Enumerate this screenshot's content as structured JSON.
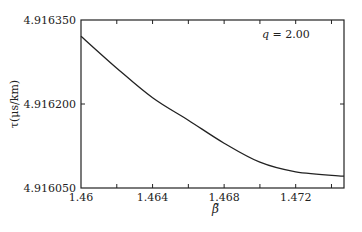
{
  "chart_data": {
    "type": "line",
    "title": "",
    "xlabel": "β̃",
    "ylabel": "τ(μs/km)",
    "annotation": "q = 2.00",
    "annotation_var": "q",
    "annotation_value": "2.00",
    "xlim": [
      1.46,
      1.4747
    ],
    "ylim": [
      4.91605,
      4.91635
    ],
    "x_ticks": [
      1.46,
      1.462,
      1.464,
      1.466,
      1.468,
      1.47,
      1.472,
      1.474
    ],
    "x_tick_labels": [
      "1.46",
      "1.464",
      "1.468",
      "1.472"
    ],
    "x_tick_label_values": [
      1.46,
      1.464,
      1.468,
      1.472
    ],
    "y_ticks": [
      4.91605,
      4.9162,
      4.91635
    ],
    "y_tick_labels": [
      "4.916050",
      "4.916200",
      "4.916350"
    ],
    "grid": false,
    "legend": null,
    "series": [
      {
        "name": "q = 2.00",
        "x": [
          1.46,
          1.462,
          1.464,
          1.466,
          1.468,
          1.47,
          1.472,
          1.4747
        ],
        "y": [
          4.916321,
          4.916264,
          4.916211,
          4.916171,
          4.91613,
          4.916096,
          4.916079,
          4.916071
        ]
      }
    ]
  }
}
